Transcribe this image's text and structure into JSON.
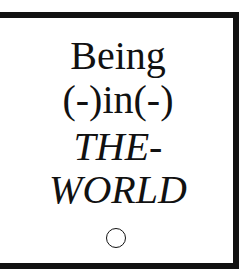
{
  "title": {
    "line1": "Being",
    "line2": "(-)in(-)",
    "line3": "THE-",
    "line4": "WORLD"
  },
  "icon": "circle-icon",
  "colors": {
    "ink": "#111111",
    "background": "#ffffff"
  }
}
